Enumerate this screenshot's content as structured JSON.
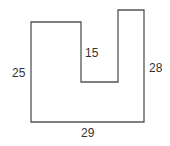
{
  "diagram": {
    "type": "rectilinear-polygon",
    "stroke_color": "#555555",
    "text_color": "#333333",
    "labels": {
      "left_side": "25",
      "notch_depth": "15",
      "right_side": "28",
      "bottom": "29"
    },
    "points": "31,22 81,22 81,82 118,82 118,10 144,10 144,122 31,122"
  }
}
